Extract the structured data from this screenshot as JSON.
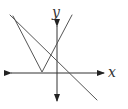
{
  "diagram": {
    "type": "graph-of-functions",
    "colors": {
      "axis": "#333333",
      "curve": "#555555",
      "background": "#ffffff"
    },
    "axes": {
      "x": {
        "label": "x",
        "y": 73,
        "x_start": 10,
        "x_end": 105
      },
      "y": {
        "label": "y",
        "x": 57,
        "y_start": 25,
        "y_end": 102
      }
    },
    "curves": [
      {
        "name": "absolute-value-v",
        "points": [
          [
            13,
            16
          ],
          [
            42,
            72
          ],
          [
            72,
            15
          ]
        ]
      },
      {
        "name": "descending-line",
        "points": [
          [
            10,
            15
          ],
          [
            97,
            100
          ]
        ]
      }
    ]
  }
}
